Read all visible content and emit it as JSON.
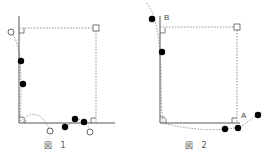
{
  "figures": [
    {
      "caption": "図 1",
      "labels": []
    },
    {
      "caption": "図 2",
      "labels": [
        "B",
        "A"
      ]
    }
  ],
  "colors": {
    "line": "#555555",
    "dotted": "#777777",
    "filled_point": "#000000",
    "open_point": "#666666"
  }
}
